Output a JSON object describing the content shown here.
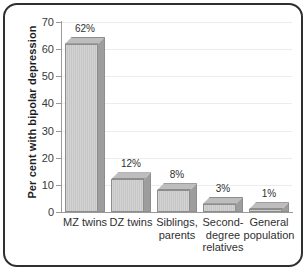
{
  "chart_data": {
    "type": "bar",
    "title": "",
    "subtitle": "",
    "xlabel": "",
    "ylabel": "Per cent with bipolar depression",
    "ylim": [
      0,
      70
    ],
    "ytick_step": 10,
    "yticks": [
      "70",
      "60",
      "50",
      "40",
      "30",
      "20",
      "10",
      "0"
    ],
    "grid": true,
    "grid_axis": "y",
    "legend": false,
    "legend_position": "none",
    "categories": [
      "MZ twins",
      "DZ twins",
      "Siblings, parents",
      "Second-degree relatives",
      "General population"
    ],
    "category_lines": [
      [
        "MZ twins"
      ],
      [
        "DZ twins"
      ],
      [
        "Siblings,",
        "parents"
      ],
      [
        "Second-",
        "degree",
        "relatives"
      ],
      [
        "General",
        "population"
      ]
    ],
    "values": [
      62,
      12,
      8,
      3,
      1
    ],
    "data_labels": [
      "62%",
      "12%",
      "8%",
      "3%",
      "1%"
    ],
    "bar_style": "3d-column",
    "colors": {
      "bar_front": "#d0d0d0",
      "bar_side": "#9d9d9d",
      "bar_top": "#bdbdbd",
      "bar_outline": "#8d8d8d",
      "gridline": "#ececec",
      "axis": "#9a9a9a",
      "text": "#2f2f31",
      "frame_border": "#2f2f31",
      "background": "#ffffff"
    }
  }
}
